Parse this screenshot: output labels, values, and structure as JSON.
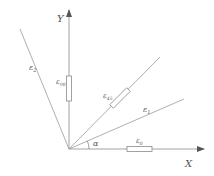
{
  "diagram": {
    "colors": {
      "line": "#9a9a9a",
      "axis": "#8a8a8a",
      "text": "#555555",
      "background": "#ffffff"
    },
    "axes": {
      "x_label": "X",
      "y_label": "Y"
    },
    "angle_label": "α",
    "strain_labels": {
      "eps2": "ε",
      "eps2_sub": "2",
      "eps90": "ε",
      "eps90_sub": "90",
      "eps45": "ε",
      "eps45_sub": "45",
      "eps1": "ε",
      "eps1_sub": "1",
      "eps0": "ε",
      "eps0_sub": "0"
    }
  }
}
